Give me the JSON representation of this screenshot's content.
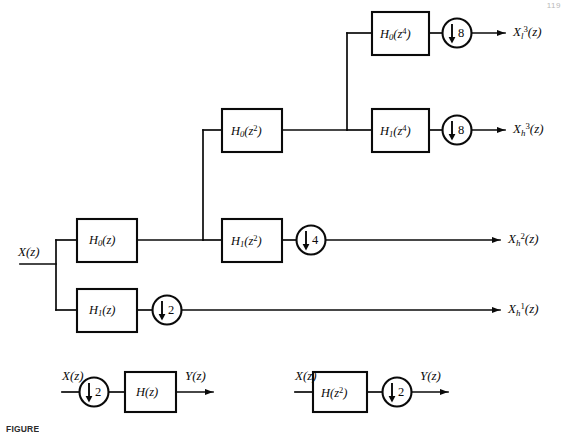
{
  "figure": {
    "type": "block-diagram",
    "page_number": "119",
    "caption": "FIGURE"
  },
  "main_tree": {
    "input": {
      "label_base": "X",
      "label_paren": "(z)",
      "full": "X(z)"
    },
    "blocks": [
      {
        "id": "h0z",
        "base": "H",
        "subscript": "0",
        "arg": "(z)",
        "arg_exp": "",
        "full": "H0(z)"
      },
      {
        "id": "h1z",
        "base": "H",
        "subscript": "1",
        "arg": "(z)",
        "arg_exp": "",
        "full": "H1(z)"
      },
      {
        "id": "h0z2",
        "base": "H",
        "subscript": "0",
        "arg": "(z",
        "arg_exp": "2",
        "full": "H0(z^2)"
      },
      {
        "id": "h1z2",
        "base": "H",
        "subscript": "1",
        "arg": "(z",
        "arg_exp": "2",
        "full": "H1(z^2)"
      },
      {
        "id": "h0z4",
        "base": "H",
        "subscript": "0",
        "arg": "(z",
        "arg_exp": "4",
        "full": "H0(z^4)"
      },
      {
        "id": "h1z4",
        "base": "H",
        "subscript": "1",
        "arg": "(z",
        "arg_exp": "4",
        "full": "H1(z^4)"
      }
    ],
    "downsamplers": [
      {
        "id": "down8a",
        "factor": "8"
      },
      {
        "id": "down8b",
        "factor": "8"
      },
      {
        "id": "down4",
        "factor": "4"
      },
      {
        "id": "down2",
        "factor": "2"
      }
    ],
    "outputs": [
      {
        "id": "out_l3",
        "base": "X",
        "subscript": "l",
        "superscript": "3",
        "paren": "(z)",
        "full": "Xl3(z)"
      },
      {
        "id": "out_h3",
        "base": "X",
        "subscript": "h",
        "superscript": "3",
        "paren": "(z)",
        "full": "Xh3(z)"
      },
      {
        "id": "out_h2",
        "base": "X",
        "subscript": "h",
        "superscript": "2",
        "paren": "(z)",
        "full": "Xh2(z)"
      },
      {
        "id": "out_h1",
        "base": "X",
        "subscript": "h",
        "superscript": "1",
        "paren": "(z)",
        "full": "Xh1(z)"
      }
    ]
  },
  "identity_left": {
    "name": "decimate-then-filter",
    "input": "X(z)",
    "output": "Y(z)",
    "down_factor": "2",
    "filter": {
      "base": "H",
      "arg": "(z)",
      "arg_exp": "",
      "full": "H(z)"
    }
  },
  "identity_right": {
    "name": "filter-then-decimate",
    "input": "X(z)",
    "output": "Y(z)",
    "down_factor": "2",
    "filter": {
      "base": "H",
      "arg": "(z",
      "arg_exp": "2",
      "full": "H(z^2)"
    }
  },
  "colors": {
    "ink": "#0a0a0a",
    "paper": "#ffffff"
  }
}
